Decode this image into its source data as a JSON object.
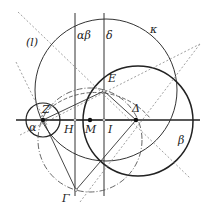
{
  "diagram": {
    "type": "geometric-construction",
    "colors": {
      "stroke": "#333333",
      "dashed": "#777777",
      "point": "#111111"
    },
    "labels": {
      "l": "(l)",
      "alpha_beta": "αβ",
      "delta_line": "δ",
      "kappa": "κ",
      "E": "E",
      "Z": "Z",
      "alpha": "α",
      "H": "H",
      "M": "M",
      "I": "I",
      "Delta": "Δ",
      "beta": "β",
      "Gamma": "Γ"
    },
    "points": {
      "Z": [
        43,
        120
      ],
      "H": [
        75,
        120
      ],
      "M": [
        90,
        120
      ],
      "I": [
        104,
        120
      ],
      "Delta": [
        136,
        120
      ],
      "E": [
        104,
        91
      ],
      "Gamma": [
        76,
        190
      ]
    },
    "circles": {
      "kappa": {
        "cx": 106,
        "cy": 90,
        "r": 71,
        "style": "solid"
      },
      "beta": {
        "cx": 138,
        "cy": 121,
        "r": 55,
        "style": "solid-bold"
      },
      "small_Z": {
        "cx": 43,
        "cy": 120,
        "r": 17,
        "style": "solid"
      },
      "dashdot": {
        "cx": 90,
        "cy": 140,
        "r": 52,
        "style": "dash-dot"
      },
      "arc_ZE": {
        "cx": 90,
        "cy": 160,
        "r": 72,
        "style": "solid-thin"
      }
    }
  }
}
